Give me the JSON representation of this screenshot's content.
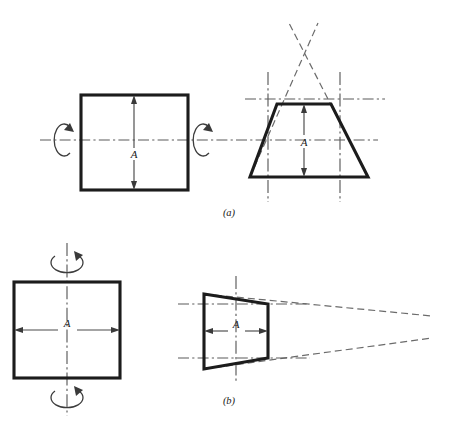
{
  "figure": {
    "type": "engineering-drawing",
    "background_color": "#ffffff",
    "line_color": "#1c1c1c",
    "centerline_color": "#5a5a5a",
    "phantom_color": "#6b6b6b",
    "panels": [
      {
        "id": "a",
        "caption": "(a)",
        "caption_position": {
          "x": 229,
          "y": 216
        },
        "axis_orientation": "horizontal",
        "left_view": {
          "name": "square-front-view",
          "shape": "square",
          "x": 81,
          "y": 95,
          "width": 107,
          "height": 95,
          "dimension_label": "A",
          "dimension_label_position": {
            "x": 134,
            "y": 155
          },
          "dimension_direction": "vertical",
          "dimension_arrow_top": {
            "x": 134,
            "y": 98
          },
          "dimension_arrow_bottom": {
            "x": 134,
            "y": 187
          }
        },
        "right_view": {
          "name": "trapezoid-tapered-view",
          "shape": "trapezoid",
          "top_left": {
            "x": 277,
            "y": 104
          },
          "top_right": {
            "x": 331,
            "y": 104
          },
          "bottom_right": {
            "x": 368,
            "y": 177
          },
          "bottom_left": {
            "x": 250,
            "y": 177
          },
          "dimension_label": "A",
          "dimension_label_position": {
            "x": 304,
            "y": 142
          },
          "dimension_direction": "vertical",
          "dimension_arrow_top": {
            "x": 304,
            "y": 107
          },
          "dimension_arrow_bottom": {
            "x": 304,
            "y": 174
          },
          "apex_crossing": {
            "x": 303,
            "y": 48
          }
        },
        "rotation_symbols": [
          {
            "name": "rotation-arrow-left",
            "cx": 64,
            "cy": 140,
            "rx": 10,
            "ry": 16,
            "direction": "clockwise"
          },
          {
            "name": "rotation-arrow-right",
            "cx": 203,
            "cy": 140,
            "rx": 10,
            "ry": 16,
            "direction": "clockwise"
          }
        ],
        "center_lines": [
          {
            "name": "main-horizontal-centerline",
            "x1": 40,
            "y1": 140,
            "x2": 378,
            "y2": 140,
            "orientation": "horizontal"
          },
          {
            "name": "upper-construction-line",
            "x1": 245,
            "y1": 99,
            "x2": 385,
            "y2": 99,
            "orientation": "horizontal"
          },
          {
            "name": "left-projection-line",
            "x": 268,
            "y1": 72,
            "y2": 202,
            "orientation": "vertical"
          },
          {
            "name": "right-projection-line",
            "x": 340,
            "y1": 72,
            "y2": 202,
            "orientation": "vertical"
          }
        ],
        "phantom_lines": [
          {
            "name": "taper-extension-left",
            "x1": 250,
            "y1": 177,
            "x2": 318,
            "y2": 23
          },
          {
            "name": "taper-extension-right",
            "x1": 368,
            "y1": 177,
            "x2": 289,
            "y2": 23
          }
        ]
      },
      {
        "id": "b",
        "caption": "(b)",
        "caption_position": {
          "x": 229,
          "y": 404
        },
        "axis_orientation": "vertical",
        "left_view": {
          "name": "square-front-view",
          "shape": "square",
          "x": 14,
          "y": 282,
          "width": 106,
          "height": 96,
          "dimension_label": "A",
          "dimension_label_position": {
            "x": 67,
            "y": 327
          },
          "dimension_direction": "horizontal",
          "dimension_arrow_left": {
            "x": 17,
            "y": 330
          },
          "dimension_arrow_right": {
            "x": 117,
            "y": 330
          }
        },
        "right_view": {
          "name": "trapezoid-tapered-view",
          "shape": "trapezoid",
          "top_left": {
            "x": 204,
            "y": 294
          },
          "top_right": {
            "x": 268,
            "y": 304
          },
          "bottom_right": {
            "x": 268,
            "y": 358
          },
          "bottom_left": {
            "x": 204,
            "y": 369
          },
          "dimension_label": "A",
          "dimension_label_position": {
            "x": 236,
            "y": 327
          },
          "dimension_direction": "horizontal",
          "dimension_arrow_left": {
            "x": 207,
            "y": 331
          },
          "dimension_arrow_right": {
            "x": 265,
            "y": 331
          },
          "apex_crossing": {
            "x": 410,
            "y": 327
          }
        },
        "rotation_symbols": [
          {
            "name": "rotation-arrow-top",
            "cx": 67,
            "cy": 262,
            "rx": 16,
            "ry": 10,
            "direction": "clockwise"
          },
          {
            "name": "rotation-arrow-bottom",
            "cx": 67,
            "cy": 397,
            "rx": 16,
            "ry": 10,
            "direction": "clockwise"
          }
        ],
        "center_lines": [
          {
            "name": "square-vertical-centerline",
            "x": 67,
            "y1": 243,
            "y2": 416,
            "orientation": "vertical"
          },
          {
            "name": "trapezoid-vertical-centerline",
            "x": 236,
            "y1": 276,
            "y2": 383,
            "orientation": "vertical"
          },
          {
            "name": "upper-projection-line",
            "x1": 178,
            "y1": 304,
            "x2": 310,
            "y2": 304,
            "orientation": "horizontal"
          },
          {
            "name": "lower-projection-line",
            "x1": 178,
            "y1": 358,
            "x2": 310,
            "y2": 358,
            "orientation": "horizontal"
          }
        ],
        "phantom_lines": [
          {
            "name": "taper-extension-top",
            "x1": 204,
            "y1": 294,
            "x2": 432,
            "y2": 316
          },
          {
            "name": "taper-extension-bottom",
            "x1": 204,
            "y1": 369,
            "x2": 432,
            "y2": 338
          }
        ]
      }
    ]
  }
}
